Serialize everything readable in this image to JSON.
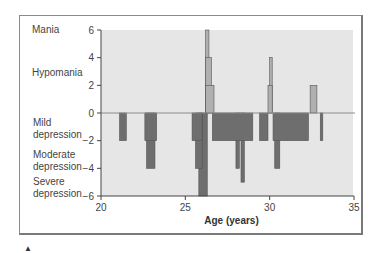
{
  "chart_data": {
    "type": "bar",
    "title": "",
    "xlabel": "Age (years)",
    "ylabel": "",
    "xlim": [
      20,
      35
    ],
    "ylim": [
      -6,
      6
    ],
    "xticks": [
      20,
      25,
      30,
      35
    ],
    "yticks": [
      6,
      4,
      2,
      0,
      -2,
      -4,
      -6
    ],
    "grid": false,
    "legend": null,
    "mood_state_labels": [
      {
        "label": "Mania",
        "y": 6
      },
      {
        "label": "Hypomania",
        "y": 3
      },
      {
        "label": "Mild depression",
        "y": -1
      },
      {
        "label": "Moderate depression",
        "y": -3
      },
      {
        "label": "Severe depression",
        "y": -5
      }
    ],
    "series": [
      {
        "name": "Depressive episodes",
        "color": "#6e6e6e",
        "segments": [
          {
            "x_start": 21.1,
            "x_end": 21.5,
            "value": -2
          },
          {
            "x_start": 22.6,
            "x_end": 23.3,
            "value": -2
          },
          {
            "x_start": 22.7,
            "x_end": 23.2,
            "value": -4
          },
          {
            "x_start": 25.4,
            "x_end": 26.0,
            "value": -2
          },
          {
            "x_start": 25.6,
            "x_end": 26.0,
            "value": -4
          },
          {
            "x_start": 25.8,
            "x_end": 26.3,
            "value": -6
          },
          {
            "x_start": 26.6,
            "x_end": 29.0,
            "value": -2
          },
          {
            "x_start": 28.0,
            "x_end": 28.2,
            "value": -4
          },
          {
            "x_start": 28.3,
            "x_end": 28.5,
            "value": -5
          },
          {
            "x_start": 29.4,
            "x_end": 29.9,
            "value": -2
          },
          {
            "x_start": 30.2,
            "x_end": 32.3,
            "value": -2
          },
          {
            "x_start": 30.3,
            "x_end": 30.6,
            "value": -4
          },
          {
            "x_start": 33.0,
            "x_end": 33.15,
            "value": -2
          }
        ]
      },
      {
        "name": "Manic/hypomanic episodes",
        "color": "#b0b0b0",
        "segments": [
          {
            "x_start": 26.2,
            "x_end": 26.4,
            "value": 6
          },
          {
            "x_start": 26.2,
            "x_end": 26.55,
            "value": 4
          },
          {
            "x_start": 26.2,
            "x_end": 26.7,
            "value": 2
          },
          {
            "x_start": 29.9,
            "x_end": 30.15,
            "value": 2
          },
          {
            "x_start": 30.0,
            "x_end": 30.15,
            "value": 4
          },
          {
            "x_start": 32.4,
            "x_end": 32.8,
            "value": 2
          }
        ]
      }
    ]
  },
  "colors": {
    "plot_background": "#e6e6e6",
    "depression_fill": "#6e6e6e",
    "mania_fill": "#b0b0b0",
    "axis": "#444444",
    "zero_line": "#8c8c8c",
    "frame": "#8a8a8a"
  },
  "labels": {
    "mania": "Mania",
    "hypomania": "Hypomania",
    "mild_1": "Mild",
    "mild_2": "depression",
    "moderate_1": "Moderate",
    "moderate_2": "depression",
    "severe_1": "Severe",
    "severe_2": "depression",
    "xlabel": "Age (years)",
    "arrow": "▲"
  }
}
